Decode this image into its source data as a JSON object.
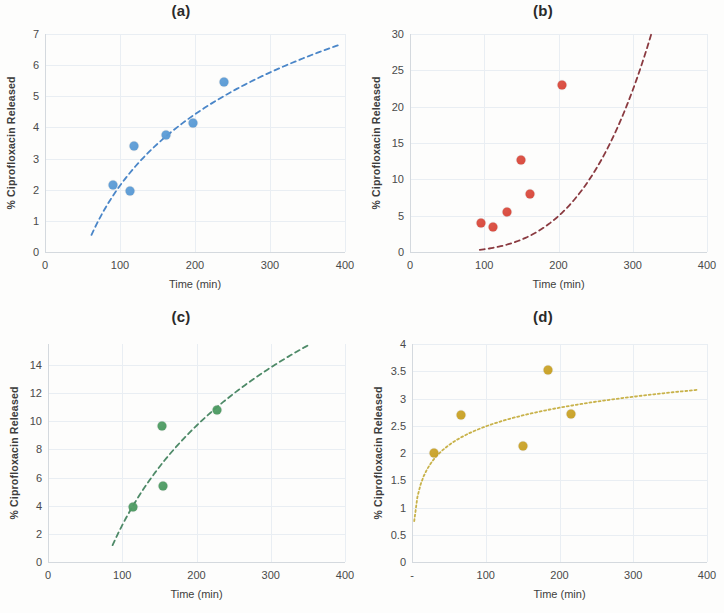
{
  "figure": {
    "shared": {
      "xlabel": "Time (min)",
      "ylabel": "% Ciprofloxacin Released",
      "xticks": [
        "0",
        "100",
        "200",
        "300",
        "400"
      ]
    }
  },
  "chart_data": [
    {
      "type": "scatter",
      "title": "(a)",
      "xlabel": "Time (min)",
      "ylabel": "% Ciprofloxacin Released",
      "xlim": [
        0,
        400
      ],
      "ylim": [
        0,
        7
      ],
      "xticks": [
        0,
        100,
        200,
        300,
        400
      ],
      "yticks": [
        0,
        1,
        2,
        3,
        4,
        5,
        6,
        7
      ],
      "xticklabels": [
        "0",
        "100",
        "200",
        "300",
        "400"
      ],
      "yticklabels": [
        "0",
        "1",
        "2",
        "3",
        "4",
        "5",
        "6",
        "7"
      ],
      "grid": true,
      "legend": "none",
      "series": [
        {
          "name": "Sample a",
          "color": "#5B9BD5",
          "marker": "circle",
          "x": [
            90,
            113,
            119,
            161,
            197,
            239
          ],
          "y": [
            2.15,
            1.95,
            3.4,
            3.75,
            4.15,
            5.45
          ]
        }
      ],
      "trendline": {
        "style": "dashed",
        "color": "#4A86C8",
        "kind": "logarithmic",
        "x_start": 62,
        "x_end": 392,
        "y_start": 0.55,
        "y_end": 6.65
      }
    },
    {
      "type": "scatter",
      "title": "(b)",
      "xlabel": "Time (min)",
      "ylabel": "% Ciprofloxacin Released",
      "xlim": [
        0,
        400
      ],
      "ylim": [
        0,
        30
      ],
      "xticks": [
        0,
        100,
        200,
        300,
        400
      ],
      "yticks": [
        0,
        5,
        10,
        15,
        20,
        25,
        30
      ],
      "xticklabels": [
        "0",
        "100",
        "200",
        "300",
        "400"
      ],
      "yticklabels": [
        "0",
        "5",
        "10",
        "15",
        "20",
        "25",
        "30"
      ],
      "grid": true,
      "legend": "none",
      "series": [
        {
          "name": "Sample b",
          "color": "#D94A3D",
          "marker": "circle",
          "x": [
            95,
            112,
            130,
            150,
            162,
            205
          ],
          "y": [
            4.0,
            3.4,
            5.5,
            12.7,
            8.0,
            23.0
          ]
        }
      ],
      "trendline": {
        "style": "dashed",
        "color": "#8A3A40",
        "kind": "power",
        "x_start": 94,
        "x_end": 325,
        "y_start": 0.3,
        "y_end": 30.0
      }
    },
    {
      "type": "scatter",
      "title": "(c)",
      "xlabel": "Time (min)",
      "ylabel": "% Ciprofloxacin Released",
      "xlim": [
        0,
        400
      ],
      "ylim": [
        0,
        15.5
      ],
      "xticks": [
        0,
        100,
        200,
        300,
        400
      ],
      "yticks": [
        0,
        2,
        4,
        6,
        8,
        10,
        12,
        14
      ],
      "xticklabels": [
        "0",
        "100",
        "200",
        "300",
        "400"
      ],
      "yticklabels": [
        "0",
        "2",
        "4",
        "6",
        "8",
        "10",
        "12",
        "14"
      ],
      "grid": true,
      "legend": "none",
      "series": [
        {
          "name": "Sample c",
          "color": "#4E9B63",
          "marker": "circle",
          "x": [
            115,
            153,
            155,
            227
          ],
          "y": [
            3.9,
            9.7,
            5.4,
            10.8
          ]
        }
      ],
      "trendline": {
        "style": "dashed",
        "color": "#4E8A68",
        "kind": "logarithmic",
        "x_start": 87,
        "x_end": 350,
        "y_start": 1.2,
        "y_end": 15.4
      }
    },
    {
      "type": "scatter",
      "title": "(d)",
      "xlabel": "Time (min)",
      "ylabel": "% Ciprofloxacin Released",
      "xlim": [
        0,
        400
      ],
      "ylim": [
        0,
        4
      ],
      "xticks": [
        0,
        100,
        200,
        300,
        400
      ],
      "yticks": [
        0,
        0.5,
        1,
        1.5,
        2,
        2.5,
        3,
        3.5,
        4
      ],
      "xticklabels": [
        "-",
        "100",
        "200",
        "300",
        "400"
      ],
      "yticklabels": [
        "0",
        "0.5",
        "1",
        "1.5",
        "2",
        "2.5",
        "3",
        "3.5",
        "4"
      ],
      "grid": true,
      "legend": "none",
      "series": [
        {
          "name": "Sample d",
          "color": "#C9A227",
          "marker": "circle",
          "x": [
            30,
            66,
            150,
            185,
            216
          ],
          "y": [
            2.0,
            2.7,
            2.12,
            3.52,
            2.72
          ]
        }
      ],
      "trendline": {
        "style": "dotted",
        "color": "#C8B24A",
        "kind": "logarithmic",
        "x_start": 3,
        "x_end": 388,
        "y_start": 0.75,
        "y_end": 3.16
      }
    }
  ]
}
